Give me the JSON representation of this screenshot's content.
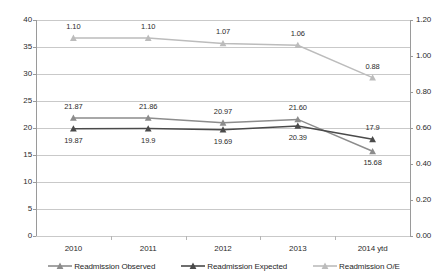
{
  "chart_data": {
    "type": "line",
    "title": "",
    "xlabel": "",
    "ylabel": "",
    "categories": [
      "2010",
      "2011",
      "2012",
      "2013",
      "2014 ytd"
    ],
    "axes": {
      "left": {
        "ylim": [
          0,
          40
        ],
        "ticks": [
          "0",
          "5",
          "10",
          "15",
          "20",
          "25",
          "30",
          "35",
          "40"
        ],
        "tick_values": [
          0,
          5,
          10,
          15,
          20,
          25,
          30,
          35,
          40
        ]
      },
      "right": {
        "ylim": [
          0.0,
          1.2
        ],
        "ticks": [
          "0.00",
          "0.20",
          "0.40",
          "0.60",
          "0.80",
          "1.00",
          "1.20"
        ],
        "tick_values": [
          0.0,
          0.2,
          0.4,
          0.6,
          0.8,
          1.0,
          1.2
        ]
      }
    },
    "grid": true,
    "legend_position": "bottom",
    "series": [
      {
        "name": "Readmission Observed",
        "axis": "left",
        "color": "#8c8c8c",
        "marker": "triangle",
        "values": [
          21.87,
          21.86,
          20.97,
          21.6,
          15.68
        ],
        "labels": [
          "21.87",
          "21.86",
          "20.97",
          "21.60",
          "15.68"
        ],
        "label_side": [
          "above",
          "above",
          "above",
          "above",
          "below"
        ]
      },
      {
        "name": "Readmission Expected",
        "axis": "left",
        "color": "#4a4a4a",
        "marker": "triangle",
        "values": [
          19.87,
          19.9,
          19.69,
          20.39,
          17.9
        ],
        "labels": [
          "19.87",
          "19.9",
          "19.69",
          "20.39",
          "17.9"
        ],
        "label_side": [
          "below",
          "below",
          "below",
          "below",
          "above"
        ]
      },
      {
        "name": "Readmission O/E",
        "axis": "right",
        "color": "#bcbcbc",
        "marker": "triangle",
        "values": [
          1.1,
          1.1,
          1.07,
          1.06,
          0.88
        ],
        "labels": [
          "1.10",
          "1.10",
          "1.07",
          "1.06",
          "0.88"
        ],
        "label_side": [
          "above",
          "above",
          "above",
          "above",
          "above"
        ]
      }
    ]
  },
  "colors": {
    "observed": "#8c8c8c",
    "expected": "#4a4a4a",
    "oe": "#bcbcbc",
    "grid": "#c9c9c9",
    "axis": "#9a9a9a",
    "text": "#2b2b2b",
    "background": "#ffffff"
  }
}
